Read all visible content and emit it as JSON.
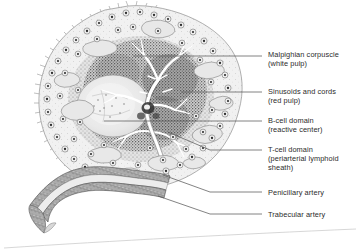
{
  "figure": {
    "style": "grayscale stippled line drawing",
    "background_color": "#ffffff",
    "ink_color": "#3a3a3a"
  },
  "labels": [
    {
      "id": "malpighian-corpuscle",
      "line1": "Malpighian corpuscle",
      "line2": "(white pulp)",
      "text_x": 268,
      "text_y": 50,
      "leader": {
        "x1": 133,
        "y1": 56,
        "x2": 262,
        "y2": 56
      }
    },
    {
      "id": "sinusoids-and-cords",
      "line1": "Sinusoids and cords",
      "line2": "(red pulp)",
      "text_x": 268,
      "text_y": 87,
      "leader": {
        "x1": 181,
        "y1": 92,
        "x2": 262,
        "y2": 92
      }
    },
    {
      "id": "b-cell-domain",
      "line1": "B-cell domain",
      "line2": "(reactive center)",
      "text_x": 268,
      "text_y": 116,
      "leader": {
        "x1": 104,
        "y1": 121,
        "x2": 262,
        "y2": 121
      }
    },
    {
      "id": "t-cell-domain",
      "line1": "T-cell domain",
      "line2": "(periarterial lymphoid",
      "line3": "sheath)",
      "text_x": 268,
      "text_y": 145,
      "leader": {
        "x1": 168,
        "y1": 132,
        "x2": 262,
        "y2": 150
      }
    },
    {
      "id": "penicillary-artery",
      "line1": "Penicillary artery",
      "text_x": 268,
      "text_y": 188,
      "leader": {
        "x1": 163,
        "y1": 175,
        "x2": 262,
        "y2": 192
      }
    },
    {
      "id": "trabecular-artery",
      "line1": "Trabecular artery",
      "text_x": 268,
      "text_y": 210,
      "leader": {
        "x1": 158,
        "y1": 196,
        "x2": 262,
        "y2": 214
      }
    }
  ],
  "diagram_regions": [
    {
      "id": "capsule-rim",
      "description": "spiky outer capsule with fibroblast cells"
    },
    {
      "id": "red-pulp",
      "description": "dark stippled red pulp with sinusoids"
    },
    {
      "id": "white-pulp",
      "description": "pale lymphoid nodule, reactive center"
    },
    {
      "id": "central-arteriole-tree",
      "description": "branching white arteriole tree"
    },
    {
      "id": "trabecular-vessel",
      "description": "wavy banded vessel wall lower left"
    }
  ]
}
